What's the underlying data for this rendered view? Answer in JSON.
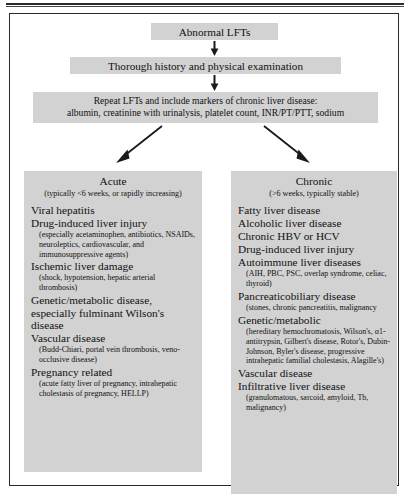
{
  "figure": {
    "type": "clinical-algorithm-flowchart",
    "colors": {
      "box_fill": "#d2d2d2",
      "text": "#111111",
      "border": "#2b2b2b",
      "page_background": "#ffffff"
    }
  },
  "flow": {
    "step1": "Abnormal LFTs",
    "step2": "Thorough history and physical examination",
    "step3_line1": "Repeat LFTs and include markers of chronic liver disease:",
    "step3_line2": "albumin, creatinine with urinalysis, platelet count, INR/PT/PTT, sodium"
  },
  "acute": {
    "title": "Acute",
    "subtitle": "(typically <6 weeks, or rapidly increasing)",
    "items": [
      {
        "label": "Viral hepatitis",
        "detail": ""
      },
      {
        "label": "Drug-induced liver injury",
        "detail": "(especially acetaminophen, antibiotics, NSAIDs, neuroleptics, cardiovascular, and immunosuppressive agents)"
      },
      {
        "label": "Ischemic liver damage",
        "detail": "(shock, hypotension, hepatic arterial thrombosis)"
      },
      {
        "label": "Genetic/metabolic disease, especially fulminant Wilson's disease",
        "detail": ""
      },
      {
        "label": "Vascular disease",
        "detail": "(Budd-Chiari, portal vein thrombosis, veno-occlusive disease)"
      },
      {
        "label": "Pregnancy related",
        "detail": "(acute fatty liver of pregnancy, intrahepatic cholestasis of pregnancy, HELLP)"
      }
    ]
  },
  "chronic": {
    "title": "Chronic",
    "subtitle": "(>6 weeks, typically stable)",
    "items": [
      {
        "label": "Fatty liver disease",
        "detail": ""
      },
      {
        "label": "Alcoholic liver disease",
        "detail": ""
      },
      {
        "label": "Chronic HBV or HCV",
        "detail": ""
      },
      {
        "label": "Drug-induced liver injury",
        "detail": ""
      },
      {
        "label": "Autoimmune liver diseases",
        "detail": "(AIH, PBC, PSC, overlap syndrome, celiac, thyroid)"
      },
      {
        "label": "Pancreaticobiliary disease",
        "detail": "(stones, chronic pancreatitis, malignancy"
      },
      {
        "label": "Genetic/metabolic",
        "detail": "(hereditary hemochromatosis, Wilson's, α1-antitrypsin, Gilbert's disease, Rotor's, Dubin-Johnson, Byler's disease, progressive intrahepatic familial cholestasis, Alagille's)"
      },
      {
        "label": "Vascular disease",
        "detail": ""
      },
      {
        "label": "Infiltrative liver disease",
        "detail": "(granulomatous, sarcoid, amyloid, Tb, malignancy)"
      }
    ]
  }
}
